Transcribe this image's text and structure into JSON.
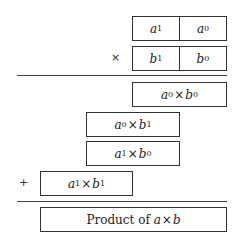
{
  "multiplicand": {
    "high": {
      "var": "a",
      "sub": "1"
    },
    "low": {
      "var": "a",
      "sub": "0"
    }
  },
  "multiplier": {
    "operator": "×",
    "high": {
      "var": "b",
      "sub": "1"
    },
    "low": {
      "var": "b",
      "sub": "0"
    }
  },
  "partial_products": [
    {
      "left": {
        "var": "a",
        "sub": "0"
      },
      "times": "×",
      "right": {
        "var": "b",
        "sub": "0"
      }
    },
    {
      "left": {
        "var": "a",
        "sub": "0"
      },
      "times": "×",
      "right": {
        "var": "b",
        "sub": "1"
      }
    },
    {
      "left": {
        "var": "a",
        "sub": "1"
      },
      "times": "×",
      "right": {
        "var": "b",
        "sub": "0"
      }
    },
    {
      "left": {
        "var": "a",
        "sub": "1"
      },
      "times": "×",
      "right": {
        "var": "b",
        "sub": "1"
      }
    }
  ],
  "sum_operator": "+",
  "result": {
    "prefix": "Product of ",
    "left_var": "a",
    "times": "×",
    "right_var": "b"
  }
}
